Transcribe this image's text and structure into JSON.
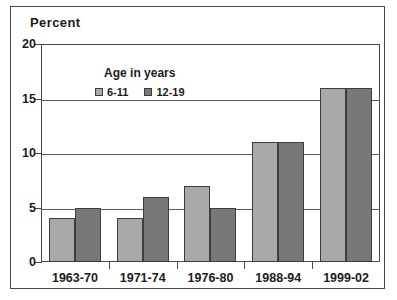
{
  "chart_data": {
    "type": "bar",
    "title": "Percent",
    "xlabel": "",
    "ylabel": "",
    "categories": [
      "1963-70",
      "1971-74",
      "1976-80",
      "1988-94",
      "1999-02"
    ],
    "series": [
      {
        "name": "6-11",
        "values": [
          4,
          4,
          7,
          11,
          16
        ],
        "color": "#a9a9a9"
      },
      {
        "name": "12-19",
        "values": [
          5,
          6,
          5,
          11,
          16
        ],
        "color": "#787878"
      }
    ],
    "legend_title": "Age in years",
    "legend_position": "inside-top-left",
    "ylim": [
      0,
      20
    ],
    "yticks": [
      0,
      5,
      10,
      15,
      20
    ],
    "ytick_labels": [
      "0",
      "5",
      "10",
      "15",
      "20"
    ],
    "grid": true,
    "grid_axis": "y"
  },
  "frame": {
    "border_color": "#4a4a4a"
  }
}
